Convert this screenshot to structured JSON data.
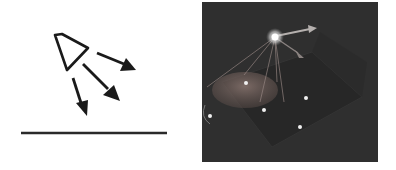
{
  "figure": {
    "left_panel": {
      "description": "Schematic of a spotlight emitting light rays toward a surface",
      "elements": [
        "spotlight-icon",
        "light-ray-arrow",
        "light-ray-arrow",
        "light-ray-arrow",
        "ground-line"
      ],
      "stroke_color": "#1a1a1a"
    },
    "right_panel": {
      "description": "3D render of a spot light illuminating a plane with sample points",
      "background_color": "#2f2f2f",
      "cone_color": "#7a6a66",
      "point_color": "#f0f0f0",
      "sample_points": 5
    }
  }
}
